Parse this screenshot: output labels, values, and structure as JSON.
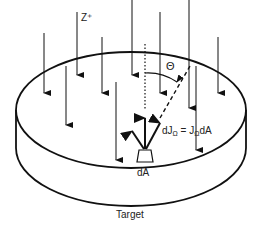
{
  "diagram": {
    "labels": {
      "z_axis": "Z⁺",
      "theta": "Θ",
      "area_element": "dA",
      "flux_formula_lhs": "dJ",
      "flux_formula_sub": "Ω",
      "flux_formula_eq": " = J",
      "flux_formula_sub2": "Ω",
      "flux_formula_rhs": "dA",
      "target": "Target"
    },
    "elements": {
      "incident_arrows": 10,
      "emitted_arrows": 3,
      "object": "cylindrical target disk"
    },
    "colors": {
      "stroke": "#111111",
      "background": "#ffffff"
    }
  }
}
